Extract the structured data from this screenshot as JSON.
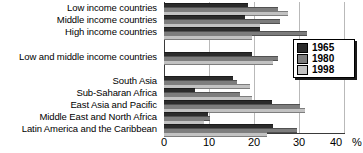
{
  "chart_data": {
    "type": "bar",
    "orientation": "horizontal",
    "title": "",
    "xlabel": "%",
    "ylabel": "",
    "xlim": [
      0,
      40
    ],
    "xticks": [
      0,
      10,
      20,
      30,
      40
    ],
    "xtick_labels": [
      "0",
      "10",
      "20",
      "30",
      "40"
    ],
    "unit_label": "%",
    "grid": true,
    "legend_position": "right",
    "categories": [
      "Low income countries",
      "Middle income countries",
      "High income countries",
      "Low and middle income countries",
      "South Asia",
      "Sub-Saharan Africa",
      "East Asia and Pacific",
      "Middle East and North Africa",
      "Latin America and the Caribbean"
    ],
    "series": [
      {
        "name": "1965",
        "color": "#2b2b2b",
        "values": [
          18.7,
          18.0,
          21.3,
          19.5,
          15.3,
          6.9,
          24.0,
          9.8,
          24.2
        ]
      },
      {
        "name": "1980",
        "color": "#7d7d7d",
        "values": [
          25.3,
          25.8,
          31.8,
          25.3,
          16.3,
          16.9,
          30.2,
          10.2,
          29.6
        ]
      },
      {
        "name": "1998",
        "color": "#c2c2c2",
        "values": [
          27.6,
          21.3,
          19.5,
          24.2,
          19.1,
          19.5,
          31.3,
          8.8,
          22.8
        ]
      }
    ]
  },
  "legend": {
    "items": [
      {
        "label": "1965",
        "color": "#2b2b2b"
      },
      {
        "label": "1980",
        "color": "#7d7d7d"
      },
      {
        "label": "1998",
        "color": "#c2c2c2"
      }
    ]
  },
  "axis": {
    "tick_0": "0",
    "tick_10": "10",
    "tick_20": "20",
    "tick_30": "30",
    "tick_40": "40",
    "unit": "%"
  },
  "labels": {
    "c0": "Low income countries",
    "c1": "Middle income countries",
    "c2": "High income countries",
    "c3": "Low and middle income countries",
    "c4": "South Asia",
    "c5": "Sub-Saharan Africa",
    "c6": "East Asia and Pacific",
    "c7": "Middle East and North Africa",
    "c8": "Latin America and the Caribbean"
  }
}
